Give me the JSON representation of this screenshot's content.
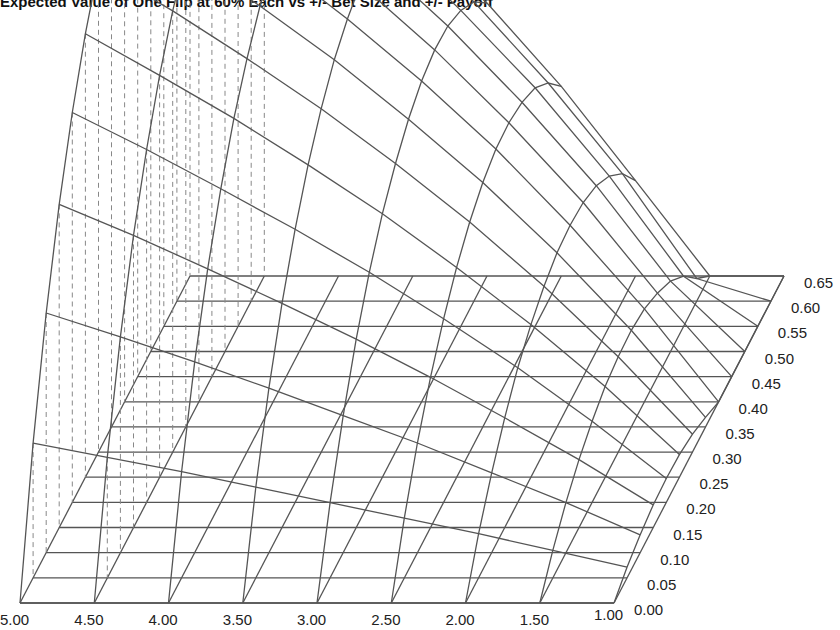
{
  "chart_data": {
    "type": "surface3d",
    "title": "Expected Value of One Flip at 60% Each vs +/- Bet Size and +/- Payoff",
    "xlabel": "",
    "ylabel": "",
    "zlabel": "",
    "x_axis": {
      "description": "payoff (front edge, left to right)",
      "tick_labels": [
        "5.00",
        "4.50",
        "4.00",
        "3.50",
        "3.00",
        "2.50",
        "2.00",
        "1.50",
        "1.00"
      ],
      "values": [
        5.0,
        4.5,
        4.0,
        3.5,
        3.0,
        2.5,
        2.0,
        1.5,
        1.0
      ]
    },
    "y_axis": {
      "description": "bet size (depth, front to back)",
      "tick_labels": [
        "0.00",
        "0.05",
        "0.10",
        "0.15",
        "0.20",
        "0.25",
        "0.30",
        "0.35",
        "0.40",
        "0.45",
        "0.50",
        "0.55",
        "0.60",
        "0.65"
      ],
      "values": [
        0.0,
        0.05,
        0.1,
        0.15,
        0.2,
        0.25,
        0.3,
        0.35,
        0.4,
        0.45,
        0.5,
        0.55,
        0.6,
        0.65
      ],
      "range": [
        0.0,
        0.65
      ]
    },
    "z_values_by_payoff": {
      "5.00": [
        0,
        0.113,
        0.201,
        0.271,
        0.327,
        0.372,
        0.407,
        0.435,
        0.455,
        0.468,
        0.474,
        0.474,
        0.465,
        0.448
      ],
      "4.50": [
        0,
        0.101,
        0.181,
        0.245,
        0.296,
        0.337,
        0.37,
        0.395,
        0.414,
        0.425,
        0.43,
        0.428,
        0.418,
        0.401
      ],
      "4.00": [
        0,
        0.089,
        0.16,
        0.217,
        0.263,
        0.301,
        0.33,
        0.353,
        0.369,
        0.379,
        0.382,
        0.379,
        0.368,
        0.349
      ],
      "3.50": [
        0,
        0.076,
        0.138,
        0.188,
        0.229,
        0.262,
        0.288,
        0.308,
        0.321,
        0.329,
        0.33,
        0.325,
        0.312,
        0.292
      ],
      "3.00": [
        0,
        0.063,
        0.115,
        0.158,
        0.193,
        0.221,
        0.242,
        0.258,
        0.269,
        0.274,
        0.273,
        0.265,
        0.251,
        0.229
      ],
      "2.50": [
        0,
        0.05,
        0.092,
        0.126,
        0.154,
        0.176,
        0.193,
        0.205,
        0.212,
        0.213,
        0.209,
        0.2,
        0.183,
        0.159
      ],
      "2.00": [
        0,
        0.037,
        0.067,
        0.092,
        0.113,
        0.128,
        0.139,
        0.146,
        0.148,
        0.146,
        0.139,
        0.126,
        0.107,
        0.08
      ],
      "1.50": [
        0,
        0.023,
        0.042,
        0.057,
        0.068,
        0.076,
        0.08,
        0.081,
        0.078,
        0.07,
        0.059,
        0.042,
        0.019,
        0
      ],
      "1.00": [
        0,
        0.009,
        0.015,
        0.019,
        0.02,
        0.019,
        0.015,
        0.008,
        0,
        0,
        0,
        0,
        0,
        0
      ]
    },
    "z_display_max": 0.48,
    "grid": true,
    "legend": "none",
    "style": {
      "line_color": "#555555",
      "dash_color": "#888888",
      "background": "#ffffff",
      "drop_lines": "dashed vertical lines below the surface"
    }
  }
}
